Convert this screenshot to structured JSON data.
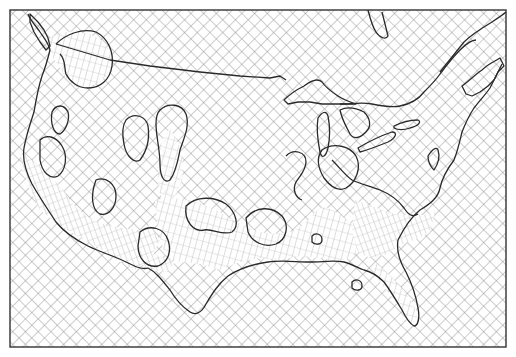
{
  "map": {
    "title": "",
    "subject": "contiguous United States grid-distortion map",
    "style": {
      "background": "#ffffff",
      "grid_color": "#8a8a8a",
      "outline_color": "#2a2a2a",
      "frame_color": "#333333",
      "mesh_color": "#9a9a9a"
    },
    "frame": {
      "x": 10,
      "y": 10,
      "width": 496,
      "height": 337
    },
    "grid": {
      "spacing": 9,
      "angle_deg": 45,
      "pattern": "crosshatch"
    },
    "labels": []
  }
}
